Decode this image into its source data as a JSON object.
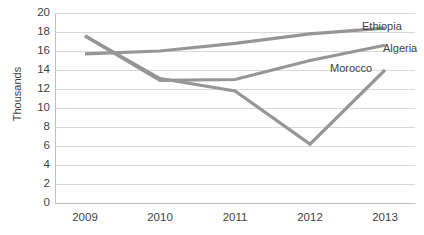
{
  "chart_data": {
    "type": "line",
    "title": "",
    "xlabel": "",
    "ylabel": "Thousands",
    "categories": [
      "2009",
      "2010",
      "2011",
      "2012",
      "2013"
    ],
    "ylim": [
      0,
      20
    ],
    "ytick_step": 2,
    "yticks": [
      "20",
      "18",
      "16",
      "14",
      "12",
      "10",
      "8",
      "6",
      "4",
      "2",
      "0"
    ],
    "grid": true,
    "legend_position": "inline-right-end-labels",
    "series": [
      {
        "name": "Ethiopia",
        "color": "#969696",
        "values": [
          15.7,
          16.0,
          16.8,
          17.8,
          18.4
        ]
      },
      {
        "name": "Algeria",
        "color": "#969696",
        "values": [
          17.6,
          12.9,
          13.0,
          15.0,
          16.6
        ]
      },
      {
        "name": "Morocco",
        "color": "#969696",
        "values": [
          17.6,
          13.1,
          11.8,
          6.2,
          14.0
        ]
      }
    ],
    "annotations": [
      {
        "text": "Ethiopia",
        "x": 362,
        "y": 20
      },
      {
        "text": "Algeria",
        "x": 383,
        "y": 42
      },
      {
        "text": "Morocco",
        "x": 330,
        "y": 62
      }
    ]
  },
  "axis": {
    "y_title": "Thousands"
  },
  "colors": {
    "line": "#969696",
    "gridline": "#d9d9d9",
    "axis": "#bfbfbf",
    "text": "#3f3f3f",
    "background": "#ffffff"
  }
}
